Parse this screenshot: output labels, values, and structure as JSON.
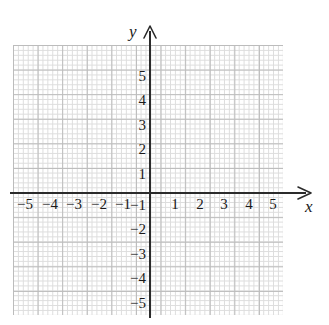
{
  "chart_data": {
    "type": "scatter",
    "title": "",
    "subtitle": "",
    "xlabel": "x",
    "ylabel": "y",
    "xlim": [
      -5.6,
      5.6
    ],
    "ylim": [
      -5.6,
      5.6
    ],
    "grid": true,
    "legend": null,
    "series": [],
    "x": [],
    "y": [],
    "annotations": [],
    "x_ticks": [
      -5,
      -4,
      -3,
      -2,
      -1,
      1,
      2,
      3,
      4,
      5
    ],
    "y_ticks": [
      5,
      4,
      3,
      2,
      1,
      -1,
      -2,
      -3,
      -4,
      -5
    ],
    "x_tick_labels": [
      "−5",
      "−4",
      "−3",
      "−2",
      "−1",
      "1",
      "2",
      "3",
      "4",
      "5"
    ],
    "y_tick_labels": [
      "5",
      "4",
      "3",
      "2",
      "1",
      "−1",
      "−2",
      "−3",
      "−4",
      "−5"
    ],
    "axis_arrows": {
      "x": "right",
      "y": "up"
    }
  },
  "axes": {
    "x_label": "x",
    "y_label": "y"
  },
  "x_ticks": [
    {
      "label": "−5",
      "left": 14
    },
    {
      "label": "−4",
      "left": 39
    },
    {
      "label": "−3",
      "left": 63
    },
    {
      "label": "−2",
      "left": 88
    },
    {
      "label": "−1",
      "left": 112
    },
    {
      "label": "1",
      "left": 164
    },
    {
      "label": "2",
      "left": 189
    },
    {
      "label": "3",
      "left": 213
    },
    {
      "label": "4",
      "left": 238
    },
    {
      "label": "5",
      "left": 262
    }
  ],
  "y_ticks": [
    {
      "label": "5",
      "top": 69
    },
    {
      "label": "4",
      "top": 93
    },
    {
      "label": "3",
      "top": 118
    },
    {
      "label": "2",
      "top": 142
    },
    {
      "label": "1",
      "top": 167
    },
    {
      "label": "−1",
      "top": 198
    },
    {
      "label": "−2",
      "top": 222
    },
    {
      "label": "−3",
      "top": 247
    },
    {
      "label": "−4",
      "top": 271
    },
    {
      "label": "−5",
      "top": 296
    }
  ],
  "colors": {
    "background": "#ffffff",
    "grid_major": "#b9b9b9",
    "grid_minor": "#dcdcdc",
    "axis": "#2b2b2b",
    "text": "#1a1a1a"
  }
}
